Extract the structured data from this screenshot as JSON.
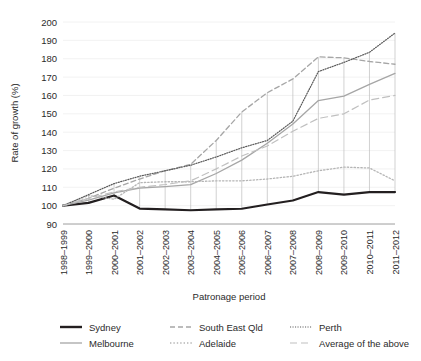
{
  "chart_data": {
    "type": "line",
    "title": "",
    "xlabel": "Patronage period",
    "ylabel": "Rate of growth (%)",
    "ylim": [
      90,
      200
    ],
    "ytick_step": 10,
    "yticks": [
      200,
      190,
      180,
      170,
      160,
      150,
      140,
      130,
      120,
      110,
      100,
      90
    ],
    "grid": true,
    "legend_position": "bottom",
    "categories": [
      "1998–1999",
      "1999–2000",
      "2000–2001",
      "2001–2002",
      "2002–2003",
      "2003–2004",
      "2004–2005",
      "2005–2006",
      "2006–2007",
      "2007–2008",
      "2008–2009",
      "2009–2010",
      "2010–2011",
      "2011–2012"
    ],
    "series": [
      {
        "name": "Sydney",
        "style": "solid",
        "color": "#231f20",
        "width": 2.2,
        "values": [
          100,
          101.5,
          105.5,
          98.4,
          98,
          97.5,
          98,
          98.3,
          100.6,
          102.8,
          107.4,
          106,
          107.4,
          107.4
        ]
      },
      {
        "name": "Melbourne",
        "style": "solid",
        "color": "#a6a6a6",
        "width": 1.3,
        "values": [
          100,
          103,
          107,
          109.6,
          110.4,
          111.4,
          117.5,
          124.8,
          134,
          144.5,
          157.2,
          159.6,
          166,
          172
        ]
      },
      {
        "name": "South East Qld",
        "style": "dashed",
        "color": "#a6a6a6",
        "width": 1.3,
        "values": [
          100,
          104,
          109.5,
          114.5,
          119,
          122.5,
          135.5,
          151,
          161.5,
          169,
          181,
          180.5,
          178.5,
          177
        ]
      },
      {
        "name": "Adelaide",
        "style": "dotted",
        "color": "#b5b5b5",
        "width": 1.3,
        "values": [
          100,
          105.5,
          103.5,
          112.5,
          113,
          113,
          113.5,
          113.5,
          114.5,
          116,
          119,
          121,
          120.5,
          113.5
        ]
      },
      {
        "name": "Perth",
        "style": "fine-dotted",
        "color": "#5a5a5a",
        "width": 1.2,
        "values": [
          100,
          106,
          112,
          116,
          119,
          122,
          126.5,
          131.5,
          135.5,
          146,
          173,
          178,
          183.5,
          194
        ]
      },
      {
        "name": "Average of the above",
        "style": "long-dash",
        "color": "#c0c0c0",
        "width": 1.2,
        "values": [
          100,
          104,
          107.5,
          110,
          111.5,
          113.5,
          120,
          127,
          132.5,
          140.5,
          147.5,
          150,
          157.5,
          160
        ]
      }
    ]
  },
  "legend": {
    "items": [
      {
        "label": "Sydney"
      },
      {
        "label": "Melbourne"
      },
      {
        "label": "South East Qld"
      },
      {
        "label": "Adelaide"
      },
      {
        "label": "Perth"
      },
      {
        "label": "Average of the above"
      }
    ]
  }
}
